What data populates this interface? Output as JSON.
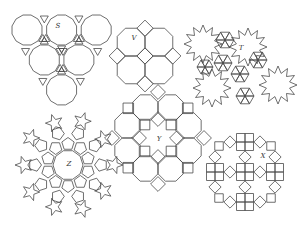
{
  "figures": [
    {
      "id": "S",
      "label": "S",
      "description": "six dodecagons in triangular arrangement with triangles between",
      "center": [
        56,
        55
      ]
    },
    {
      "id": "V",
      "label": "V",
      "description": "four octagons in 2x2 arrangement with squares",
      "center": [
        145,
        55
      ]
    },
    {
      "id": "T",
      "label": "T",
      "description": "twelve-point stars joined by hexagonal triangle patches",
      "center": [
        240,
        65
      ]
    },
    {
      "id": "Z",
      "label": "Z",
      "description": "pentagons and five-point stars around a central decagon",
      "center": [
        68,
        165
      ]
    },
    {
      "id": "Y",
      "label": "Y",
      "description": "ring of octagons with squares around central region",
      "center": [
        158,
        138
      ]
    },
    {
      "id": "X",
      "label": "X",
      "description": "ring of squares, rotated squares and 2x2 square blocks",
      "center": [
        252,
        165
      ]
    }
  ],
  "colors": {
    "line": "#4a4a4a",
    "background": "#ffffff",
    "label": "#333333"
  }
}
